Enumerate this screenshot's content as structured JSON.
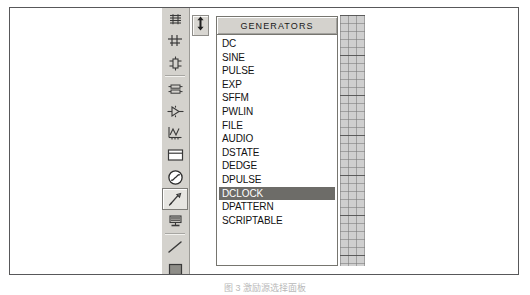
{
  "figure": {
    "caption": "图 3  激励源选择面板"
  },
  "toolbar": {
    "name": "Mode Selector Toolbar",
    "items": [
      {
        "label": "Component Mode",
        "icon": "component-icon",
        "selected": false
      },
      {
        "label": "Junction Dot Mode",
        "icon": "junction-dot-icon",
        "selected": false
      },
      {
        "label": "Wire Label Mode",
        "icon": "wire-label-icon",
        "selected": false
      },
      {
        "label": "Text Script Mode",
        "icon": "text-script-icon",
        "selected": false
      },
      {
        "label": "Bus Mode",
        "icon": "bus-icon",
        "selected": false
      },
      {
        "label": "Subcircuit Mode",
        "icon": "subcircuit-icon",
        "selected": false
      },
      {
        "label": "Graph Mode",
        "icon": "graph-icon",
        "selected": false
      },
      {
        "label": "Tape Recorder Mode",
        "icon": "tape-recorder-icon",
        "selected": false
      },
      {
        "label": "Generator Mode",
        "icon": "generator-icon",
        "selected": true
      },
      {
        "label": "Voltage Probe Mode",
        "icon": "voltage-probe-icon",
        "selected": false
      },
      {
        "label": "Current Probe Mode",
        "icon": "current-probe-icon",
        "selected": false
      },
      {
        "label": "2D Line Mode",
        "icon": "line-tool-icon",
        "selected": false
      },
      {
        "label": "2D Box Mode",
        "icon": "box-tool-icon",
        "selected": false
      },
      {
        "label": "2D Circle Mode",
        "icon": "circle-tool-icon",
        "selected": false
      }
    ]
  },
  "drag_handle": {
    "label": "Resize Panel",
    "icon": "vertical-double-arrow-icon"
  },
  "object_selector": {
    "header": "GENERATORS",
    "selected_index": 11,
    "items": [
      "DC",
      "SINE",
      "PULSE",
      "EXP",
      "SFFM",
      "PWLIN",
      "FILE",
      "AUDIO",
      "DSTATE",
      "DEDGE",
      "DPULSE",
      "DCLOCK",
      "DPATTERN",
      "SCRIPTABLE"
    ]
  },
  "canvas": {
    "label": "Schematic Grid Canvas"
  },
  "colors": {
    "panel_face": "#d4d2cd",
    "panel_border": "#76756f",
    "selection_bg": "#6d6c68",
    "selection_fg": "#ffffff",
    "frame_border": "#58585a",
    "grid_line": "#787878"
  }
}
